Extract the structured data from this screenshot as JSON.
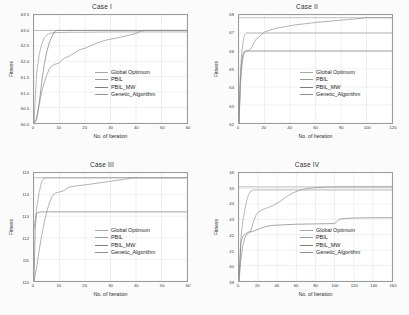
{
  "figure": {
    "background": "#fbfbfb",
    "axis_color": "#9a9a9a",
    "grid_color": "#d8d8d8",
    "series_color": "#8a8a8a"
  },
  "common": {
    "xlabel": "No. of Iteration",
    "ylabel": "Fitness",
    "legend": [
      {
        "label": "Global Optimum",
        "color": "#a8a8a8"
      },
      {
        "label": "PBIL",
        "color": "#9a9a9a"
      },
      {
        "label": "PBIL_MW",
        "color": "#7d7d7d"
      },
      {
        "label": "Genetic_Algorithm",
        "color": "#8f8f8f"
      }
    ]
  },
  "chart_data": [
    {
      "type": "line",
      "title": "Case I",
      "xlabel": "No. of Iteration",
      "ylabel": "Fitness",
      "xlim": [
        0,
        60
      ],
      "ylim": [
        60.0,
        63.5
      ],
      "xticks": [
        0,
        10,
        20,
        30,
        40,
        50,
        60
      ],
      "yticks": [
        60.0,
        60.5,
        61.0,
        61.5,
        62.0,
        62.5,
        63.0,
        63.5
      ],
      "ytick_labels": [
        "60.0",
        "60.5",
        "61.0",
        "61.5",
        "62.0",
        "62.5",
        "63.0",
        "63.5"
      ],
      "xtick_labels": [
        "0",
        "10",
        "20",
        "30",
        "40",
        "50",
        "60"
      ],
      "grid": true,
      "legend_position": "center-right",
      "series": [
        {
          "name": "Global Optimum",
          "x": [
            0,
            60
          ],
          "y": [
            63.0,
            63.0
          ]
        },
        {
          "name": "PBIL",
          "x": [
            0,
            1,
            2,
            3,
            4,
            5,
            6,
            7,
            8,
            10,
            14,
            20,
            30,
            40,
            50,
            60
          ],
          "y": [
            60.0,
            61.6,
            62.2,
            62.55,
            62.75,
            62.85,
            62.9,
            62.92,
            62.93,
            62.93,
            62.94,
            62.94,
            62.95,
            62.95,
            62.95,
            62.95
          ]
        },
        {
          "name": "PBIL_MW",
          "x": [
            0,
            1,
            2,
            3,
            4,
            5,
            6,
            7,
            8,
            9,
            10,
            12,
            16,
            22,
            30,
            40,
            60
          ],
          "y": [
            60.0,
            60.1,
            60.6,
            61.3,
            61.9,
            62.3,
            62.6,
            62.8,
            62.95,
            63.0,
            63.0,
            63.0,
            63.0,
            63.0,
            63.0,
            63.0,
            63.0
          ]
        },
        {
          "name": "Genetic_Algorithm",
          "x": [
            0,
            1,
            2,
            3,
            4,
            5,
            6,
            7,
            8,
            9,
            10,
            11,
            12,
            14,
            16,
            18,
            20,
            22,
            25,
            28,
            32,
            36,
            40,
            42,
            44,
            46,
            50,
            55,
            60
          ],
          "y": [
            60.0,
            60.15,
            60.6,
            61.0,
            61.3,
            61.55,
            61.75,
            61.85,
            61.9,
            61.92,
            61.95,
            62.05,
            62.1,
            62.18,
            62.28,
            62.38,
            62.42,
            62.5,
            62.6,
            62.68,
            62.75,
            62.82,
            62.9,
            62.98,
            63.0,
            63.0,
            63.0,
            63.0,
            63.0
          ]
        }
      ]
    },
    {
      "type": "line",
      "title": "Case II",
      "xlabel": "No. of Iteration",
      "ylabel": "Fitness",
      "xlim": [
        0,
        120
      ],
      "ylim": [
        62,
        68
      ],
      "xticks": [
        0,
        20,
        40,
        60,
        80,
        100,
        120
      ],
      "yticks": [
        62,
        63,
        64,
        65,
        66,
        67,
        68
      ],
      "ytick_labels": [
        "62",
        "63",
        "64",
        "65",
        "66",
        "67",
        "68"
      ],
      "xtick_labels": [
        "0",
        "20",
        "40",
        "60",
        "80",
        "100",
        "120"
      ],
      "grid": true,
      "legend_position": "center-right",
      "series": [
        {
          "name": "Global Optimum",
          "x": [
            0,
            120
          ],
          "y": [
            67.85,
            67.85
          ]
        },
        {
          "name": "PBIL",
          "x": [
            0,
            1,
            2,
            3,
            4,
            5,
            6,
            8,
            12,
            20,
            40,
            80,
            120
          ],
          "y": [
            62.0,
            64.6,
            65.8,
            66.4,
            66.8,
            66.95,
            67.0,
            67.0,
            67.0,
            67.0,
            67.0,
            67.0,
            67.0
          ]
        },
        {
          "name": "PBIL_MW",
          "x": [
            0,
            1,
            2,
            3,
            4,
            5,
            6,
            8,
            12,
            20,
            40,
            80,
            120
          ],
          "y": [
            62.0,
            64.2,
            65.3,
            65.8,
            65.95,
            66.0,
            66.0,
            66.0,
            66.0,
            66.0,
            66.0,
            66.0,
            66.0
          ]
        },
        {
          "name": "Genetic_Algorithm",
          "x": [
            0,
            1,
            2,
            3,
            4,
            5,
            6,
            8,
            10,
            12,
            14,
            16,
            18,
            20,
            24,
            28,
            32,
            38,
            44,
            50,
            56,
            62,
            70,
            78,
            86,
            94,
            100,
            108,
            116,
            120
          ],
          "y": [
            62.0,
            64.0,
            65.0,
            65.6,
            65.85,
            65.95,
            66.0,
            66.05,
            66.2,
            66.5,
            66.7,
            66.8,
            66.95,
            67.05,
            67.15,
            67.25,
            67.3,
            67.38,
            67.45,
            67.5,
            67.55,
            67.6,
            67.65,
            67.7,
            67.75,
            67.8,
            67.85,
            67.85,
            67.85,
            67.85
          ]
        }
      ]
    },
    {
      "type": "line",
      "title": "Case III",
      "xlabel": "No. of Iteration",
      "ylabel": "Fitness",
      "xlim": [
        0,
        60
      ],
      "ylim": [
        110,
        115
      ],
      "xticks": [
        0,
        10,
        20,
        30,
        40,
        50,
        60
      ],
      "yticks": [
        110,
        111,
        112,
        113,
        114,
        115
      ],
      "ytick_labels": [
        "110",
        "111",
        "112",
        "113",
        "114",
        "115"
      ],
      "xtick_labels": [
        "0",
        "10",
        "20",
        "30",
        "40",
        "50",
        "60"
      ],
      "grid": true,
      "legend_position": "center-right",
      "series": [
        {
          "name": "Global Optimum",
          "x": [
            0,
            60
          ],
          "y": [
            114.78,
            114.78
          ]
        },
        {
          "name": "PBIL",
          "x": [
            0,
            1,
            2,
            3,
            4,
            5,
            6,
            8,
            12,
            20,
            40,
            60
          ],
          "y": [
            112.4,
            113.3,
            114.1,
            114.6,
            114.75,
            114.78,
            114.78,
            114.78,
            114.78,
            114.78,
            114.78,
            114.78
          ]
        },
        {
          "name": "PBIL_MW",
          "x": [
            0,
            0.5,
            1,
            2,
            3,
            4,
            6,
            10,
            20,
            40,
            60
          ],
          "y": [
            110.0,
            112.5,
            113.15,
            113.18,
            113.2,
            113.2,
            113.2,
            113.2,
            113.2,
            113.2,
            113.2
          ]
        },
        {
          "name": "Genetic_Algorithm",
          "x": [
            0,
            1,
            2,
            3,
            4,
            5,
            6,
            7,
            8,
            9,
            10,
            11,
            12,
            13,
            14,
            16,
            18,
            20,
            23,
            26,
            29,
            32,
            35,
            38,
            40,
            45,
            50,
            55,
            60
          ],
          "y": [
            110.0,
            110.6,
            111.4,
            112.1,
            112.7,
            113.2,
            113.6,
            113.9,
            114.05,
            114.1,
            114.12,
            114.15,
            114.2,
            114.3,
            114.35,
            114.4,
            114.42,
            114.45,
            114.5,
            114.55,
            114.6,
            114.65,
            114.7,
            114.76,
            114.78,
            114.78,
            114.78,
            114.78,
            114.78
          ]
        }
      ]
    },
    {
      "type": "line",
      "title": "Case IV",
      "xlabel": "No. of Iteration",
      "ylabel": "Fitness",
      "xlim": [
        0,
        160
      ],
      "ylim": [
        39,
        46
      ],
      "xticks": [
        0,
        20,
        40,
        60,
        80,
        100,
        120,
        140,
        160
      ],
      "yticks": [
        39,
        40,
        41,
        42,
        43,
        44,
        45,
        46
      ],
      "ytick_labels": [
        "39",
        "40",
        "41",
        "42",
        "43",
        "44",
        "45",
        "46"
      ],
      "xtick_labels": [
        "0",
        "20",
        "40",
        "60",
        "80",
        "100",
        "120",
        "140",
        "160"
      ],
      "grid": true,
      "legend_position": "center-right",
      "series": [
        {
          "name": "Global Optimum",
          "x": [
            0,
            160
          ],
          "y": [
            45.1,
            45.1
          ]
        },
        {
          "name": "PBIL",
          "x": [
            0,
            2,
            4,
            6,
            8,
            10,
            12,
            14,
            16,
            20,
            40,
            80,
            120,
            160
          ],
          "y": [
            39.0,
            41.8,
            42.9,
            43.6,
            44.2,
            44.6,
            44.8,
            44.88,
            44.9,
            44.9,
            44.9,
            44.9,
            44.9,
            44.9
          ]
        },
        {
          "name": "PBIL_MW",
          "x": [
            0,
            2,
            4,
            6,
            8,
            10,
            14,
            18,
            22,
            26,
            30,
            34,
            40,
            50,
            60,
            80,
            100,
            105,
            110,
            120,
            140,
            160
          ],
          "y": [
            39.0,
            41.5,
            41.9,
            42.0,
            42.1,
            42.18,
            42.2,
            42.3,
            42.4,
            42.5,
            42.55,
            42.6,
            42.62,
            42.65,
            42.68,
            42.7,
            42.72,
            43.0,
            43.05,
            43.08,
            43.1,
            43.1
          ]
        },
        {
          "name": "Genetic_Algorithm",
          "x": [
            0,
            2,
            4,
            6,
            8,
            10,
            12,
            14,
            16,
            18,
            20,
            24,
            28,
            32,
            36,
            40,
            44,
            48,
            52,
            56,
            60,
            64,
            68,
            72,
            76,
            80,
            90,
            100,
            110,
            120,
            140,
            160
          ],
          "y": [
            39.0,
            40.4,
            41.3,
            41.8,
            42.0,
            42.1,
            42.2,
            42.6,
            43.0,
            43.3,
            43.45,
            43.6,
            43.7,
            43.8,
            43.9,
            44.05,
            44.2,
            44.4,
            44.55,
            44.7,
            44.8,
            44.9,
            44.95,
            45.0,
            45.02,
            45.05,
            45.08,
            45.1,
            45.1,
            45.1,
            45.1,
            45.1
          ]
        }
      ]
    }
  ]
}
